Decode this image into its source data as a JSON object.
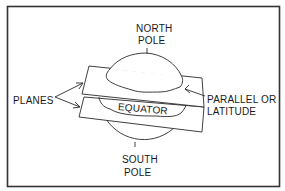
{
  "figure": {
    "type": "labeled-diagram"
  },
  "labels": {
    "north_pole": [
      "NORTH",
      "POLE"
    ],
    "south_pole": [
      "SOUTH",
      "POLE"
    ],
    "planes": "PLANES",
    "equator": "EQUATOR",
    "parallel": [
      "PARALLEL OR",
      "LATITUDE"
    ]
  },
  "colors": {
    "line": "#2a2a2a",
    "background": "#ffffff",
    "border": "#333333"
  }
}
